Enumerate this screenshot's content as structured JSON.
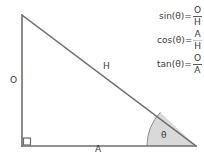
{
  "diagram": {
    "background_color": "#ffffff",
    "stroke_color": "#6e6e6e",
    "text_color": "#3a3a3a",
    "sector_fill_color": "#d9d9d9",
    "labels": {
      "opposite": "O",
      "hypotenuse": "H",
      "adjacent": "A",
      "angle": "θ"
    },
    "geometry": {
      "apex": [
        22,
        15
      ],
      "right_angle_vertex": [
        22,
        146
      ],
      "right_vertex": [
        196,
        146
      ],
      "right_angle_marker_size": 7,
      "arc_radius": 49
    }
  },
  "formulas": [
    {
      "name": "sine",
      "lhs": "sin(θ)=",
      "numerator": "O",
      "denominator": "H",
      "bar_style": "solid"
    },
    {
      "name": "cosine",
      "lhs": "cos(θ)=",
      "numerator": "A",
      "denominator": "H",
      "bar_style": "faint"
    },
    {
      "name": "tangent",
      "lhs": "tan(θ)=",
      "numerator": "O",
      "denominator": "A",
      "bar_style": "solid"
    }
  ]
}
